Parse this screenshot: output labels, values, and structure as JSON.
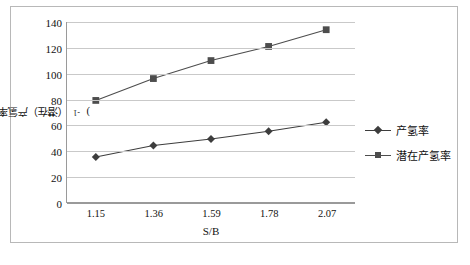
{
  "chart_data": {
    "type": "line",
    "title": "",
    "xlabel": "S/B",
    "ylabel": "（潜在）产氢率/(g · kg⁻¹)",
    "categories": [
      "1.15",
      "1.36",
      "1.59",
      "1.78",
      "2.07"
    ],
    "ylim": [
      0,
      140
    ],
    "yticks": [
      "0",
      "20",
      "40",
      "60",
      "80",
      "100",
      "120",
      "140"
    ],
    "grid": true,
    "legend_position": "right",
    "series": [
      {
        "name": "产氢率",
        "marker": "diamond",
        "color": "#3d3d3d",
        "values": [
          35,
          44,
          49,
          55,
          62
        ]
      },
      {
        "name": "潜在产氢率",
        "marker": "square",
        "color": "#4d4d4d",
        "values": [
          79,
          96,
          110,
          121,
          134
        ]
      }
    ]
  },
  "axes": {
    "y_title_main": "（潜在）产氢率/(g · kg",
    "y_title_sup": "-1",
    "y_title_tail": ")",
    "x_title": "S/B"
  },
  "colors": {
    "frame": "#b8b8b8",
    "gridline": "#c9c9c9",
    "axis": "#9a9a9a",
    "series_1": "#3d3d3d",
    "series_2": "#4d4d4d",
    "text": "#111111"
  }
}
